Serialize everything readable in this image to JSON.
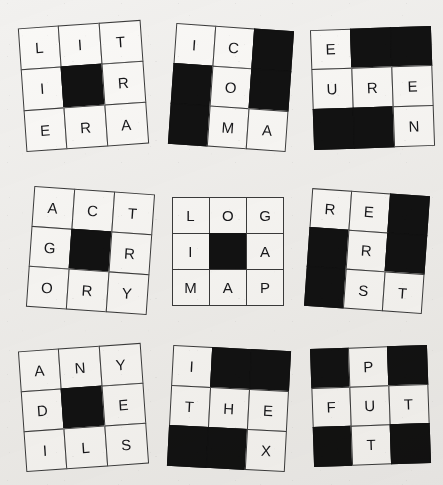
{
  "page": {
    "background_color": "#f2f1ef",
    "ink_color": "#17171a",
    "blocked_cell_color": "#121212",
    "cell_color": "#faf9f7",
    "grid_count": 9
  },
  "grids": [
    {
      "id": "grid-1",
      "rotation_deg": -4,
      "left": 22,
      "top": 24,
      "width": 122,
      "height": 124,
      "rows": [
        [
          "L",
          "I",
          "T"
        ],
        [
          "I",
          "",
          "R"
        ],
        [
          "E",
          "R",
          "A"
        ]
      ],
      "blocked": [
        [
          false,
          false,
          false
        ],
        [
          false,
          true,
          false
        ],
        [
          false,
          false,
          false
        ]
      ]
    },
    {
      "id": "grid-2",
      "rotation_deg": 4,
      "left": 172,
      "top": 27,
      "width": 118,
      "height": 120,
      "rows": [
        [
          "I",
          "C",
          ""
        ],
        [
          "",
          "O",
          ""
        ],
        [
          "",
          "M",
          "A"
        ]
      ],
      "blocked": [
        [
          false,
          false,
          true
        ],
        [
          true,
          false,
          true
        ],
        [
          true,
          false,
          false
        ]
      ]
    },
    {
      "id": "grid-3",
      "rotation_deg": -2,
      "left": 312,
      "top": 28,
      "width": 121,
      "height": 119,
      "rows": [
        [
          "E",
          "",
          ""
        ],
        [
          "U",
          "R",
          "E"
        ],
        [
          "",
          "",
          "N"
        ]
      ],
      "blocked": [
        [
          false,
          true,
          true
        ],
        [
          false,
          false,
          false
        ],
        [
          true,
          true,
          false
        ]
      ]
    },
    {
      "id": "grid-4",
      "rotation_deg": 4,
      "left": 30,
      "top": 190,
      "width": 120,
      "height": 120,
      "rows": [
        [
          "A",
          "C",
          "T"
        ],
        [
          "G",
          "",
          "R"
        ],
        [
          "O",
          "R",
          "Y"
        ]
      ],
      "blocked": [
        [
          false,
          false,
          false
        ],
        [
          false,
          true,
          false
        ],
        [
          false,
          false,
          false
        ]
      ]
    },
    {
      "id": "grid-5",
      "rotation_deg": 0,
      "left": 172,
      "top": 197,
      "width": 112,
      "height": 109,
      "rows": [
        [
          "L",
          "O",
          "G"
        ],
        [
          "I",
          "",
          "A"
        ],
        [
          "M",
          "A",
          "P"
        ]
      ],
      "blocked": [
        [
          false,
          false,
          false
        ],
        [
          false,
          true,
          false
        ],
        [
          false,
          false,
          false
        ]
      ]
    },
    {
      "id": "grid-6",
      "rotation_deg": 4,
      "left": 308,
      "top": 192,
      "width": 117,
      "height": 118,
      "rows": [
        [
          "R",
          "E",
          ""
        ],
        [
          "",
          "R",
          ""
        ],
        [
          "",
          "S",
          "T"
        ]
      ],
      "blocked": [
        [
          false,
          false,
          true
        ],
        [
          true,
          false,
          true
        ],
        [
          true,
          false,
          false
        ]
      ]
    },
    {
      "id": "grid-7",
      "rotation_deg": -4,
      "left": 22,
      "top": 347,
      "width": 122,
      "height": 121,
      "rows": [
        [
          "A",
          "N",
          "Y"
        ],
        [
          "D",
          "",
          "E"
        ],
        [
          "I",
          "L",
          "S"
        ]
      ],
      "blocked": [
        [
          false,
          false,
          false
        ],
        [
          false,
          true,
          false
        ],
        [
          false,
          false,
          false
        ]
      ]
    },
    {
      "id": "grid-8",
      "rotation_deg": 3,
      "left": 170,
      "top": 348,
      "width": 118,
      "height": 121,
      "rows": [
        [
          "I",
          "",
          ""
        ],
        [
          "T",
          "H",
          "E"
        ],
        [
          "",
          "",
          "X"
        ]
      ],
      "blocked": [
        [
          false,
          true,
          true
        ],
        [
          false,
          false,
          false
        ],
        [
          true,
          true,
          false
        ]
      ]
    },
    {
      "id": "grid-9",
      "rotation_deg": -2,
      "left": 312,
      "top": 347,
      "width": 116,
      "height": 117,
      "rows": [
        [
          "",
          "P",
          ""
        ],
        [
          "F",
          "U",
          "T"
        ],
        [
          "",
          "T",
          ""
        ]
      ],
      "blocked": [
        [
          true,
          false,
          true
        ],
        [
          false,
          false,
          false
        ],
        [
          true,
          false,
          true
        ]
      ]
    }
  ]
}
